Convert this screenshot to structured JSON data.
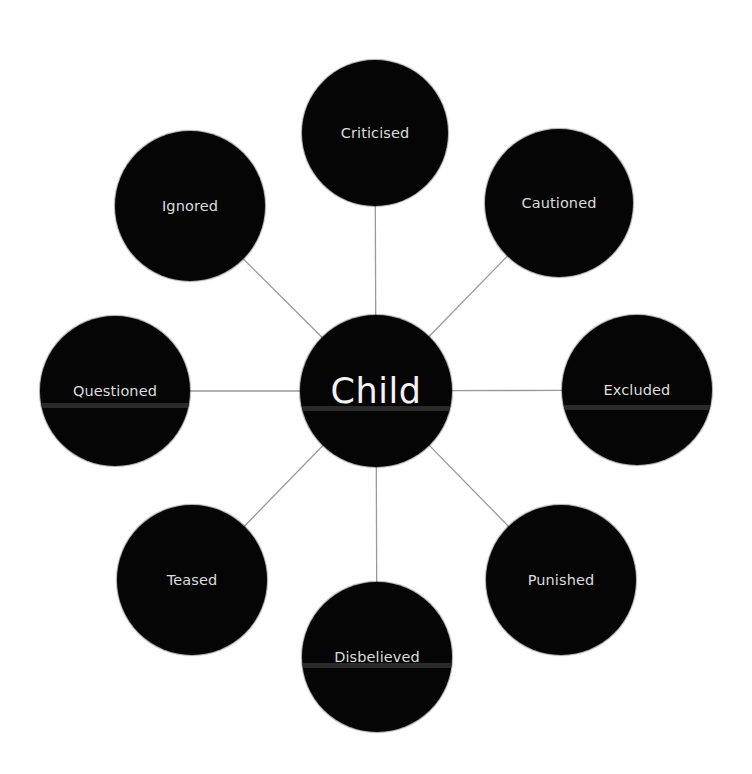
{
  "diagram": {
    "type": "radial-hub-and-spoke",
    "colors": {
      "background": "#ffffff",
      "node_fill": "#050505",
      "node_text": "#dcdcdc",
      "center_text": "#f2f2f2",
      "edge": "#9a9a9a",
      "band": "#2a2a2a"
    },
    "center": {
      "label": "Child",
      "cx": 376,
      "cy": 391,
      "r": 76
    },
    "nodes": [
      {
        "id": "criticised",
        "label": "Criticised",
        "cx": 375,
        "cy": 133,
        "r": 73,
        "band": false
      },
      {
        "id": "cautioned",
        "label": "Cautioned",
        "cx": 559,
        "cy": 203,
        "r": 74,
        "band": false
      },
      {
        "id": "excluded",
        "label": "Excluded",
        "cx": 637,
        "cy": 390,
        "r": 75,
        "band": true,
        "band_y": 407
      },
      {
        "id": "punished",
        "label": "Punished",
        "cx": 561,
        "cy": 580,
        "r": 75,
        "band": false
      },
      {
        "id": "disbelieved",
        "label": "Disbelieved",
        "cx": 377,
        "cy": 657,
        "r": 75,
        "band": true,
        "band_y": 665
      },
      {
        "id": "teased",
        "label": "Teased",
        "cx": 192,
        "cy": 580,
        "r": 75,
        "band": false
      },
      {
        "id": "questioned",
        "label": "Questioned",
        "cx": 115,
        "cy": 391,
        "r": 75,
        "band": true,
        "band_y": 405
      },
      {
        "id": "ignored",
        "label": "Ignored",
        "cx": 190,
        "cy": 206,
        "r": 75,
        "band": false
      }
    ],
    "center_band_y": 408
  }
}
